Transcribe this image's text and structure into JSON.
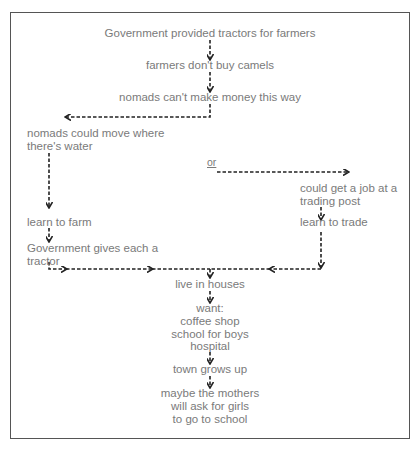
{
  "diagram": {
    "nodes": {
      "n1": "Government provided tractors for farmers",
      "n2": "farmers don't buy camels",
      "n3": "nomads can't make money this way",
      "n4a": "nomads could move where",
      "n4b": "there's water",
      "or": "or",
      "n5a": "could get a job at a",
      "n5b": "trading post",
      "n6": "learn to farm",
      "n7a": "Government gives each a",
      "n7b": "tractor",
      "n8": "learn to trade",
      "n9": "live in houses",
      "n10a": "want:",
      "n10b": "coffee shop",
      "n10c": "school for boys",
      "n10d": "hospital",
      "n11": "town grows up",
      "n12a": "maybe the mothers",
      "n12b": "will ask for girls",
      "n12c": "to go to school"
    },
    "edges": [
      {
        "from": "Government provided tractors for farmers",
        "to": "farmers don't buy camels"
      },
      {
        "from": "farmers don't buy camels",
        "to": "nomads can't make money this way"
      },
      {
        "from": "nomads can't make money this way",
        "to": "nomads could move where there's water"
      },
      {
        "from": "nomads can't make money this way",
        "to": "could get a job at a trading post",
        "label": "or"
      },
      {
        "from": "nomads could move where there's water",
        "to": "learn to farm"
      },
      {
        "from": "learn to farm",
        "to": "Government gives each a tractor"
      },
      {
        "from": "could get a job at a trading post",
        "to": "learn to trade"
      },
      {
        "from": "Government gives each a tractor",
        "to": "live in houses"
      },
      {
        "from": "learn to trade",
        "to": "live in houses"
      },
      {
        "from": "live in houses",
        "to": "want: coffee shop, school for boys, hospital"
      },
      {
        "from": "want: coffee shop, school for boys, hospital",
        "to": "town grows up"
      },
      {
        "from": "town grows up",
        "to": "maybe the mothers will ask for girls to go to school"
      }
    ],
    "colors": {
      "text": "#7a7a7a",
      "arrow": "#222222",
      "border": "#555555"
    }
  }
}
